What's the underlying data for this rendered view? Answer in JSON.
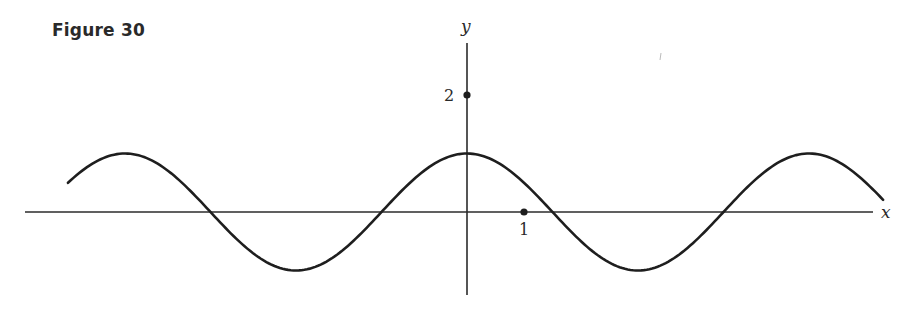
{
  "figure": {
    "title": "Figure 30"
  },
  "axes": {
    "x_label": "x",
    "y_label": "y",
    "marked_points": [
      {
        "label": "2",
        "x": 0,
        "y": 2
      },
      {
        "label": "1",
        "x": 1,
        "y": 0
      }
    ]
  },
  "colors": {
    "ink": "#1e1e1e",
    "background": "#ffffff"
  },
  "chart_data": {
    "type": "line",
    "title": "Figure 30",
    "xlabel": "x",
    "ylabel": "y",
    "function": "y = cos(pi*x/3)",
    "amplitude": 1,
    "period": 6,
    "xlim": [
      -7.2,
      7.1
    ],
    "ylim": [
      -1.4,
      2.9
    ],
    "grid": false,
    "legend": null,
    "labeled_ticks": {
      "x": [
        1
      ],
      "y": [
        2
      ]
    },
    "key_points": {
      "maxima": [
        [
          -6,
          1
        ],
        [
          0,
          1
        ],
        [
          6,
          1
        ]
      ],
      "minima": [
        [
          -3,
          -1
        ],
        [
          3,
          -1
        ]
      ],
      "zeros": [
        -4.5,
        -1.5,
        1.5,
        4.5
      ]
    },
    "curve_x_range": [
      -7.0,
      7.3
    ],
    "series": [
      {
        "name": "y = cos(pi x / 3)",
        "x": [
          -7,
          -6,
          -5,
          -4.5,
          -4,
          -3,
          -2,
          -1.5,
          -1,
          0,
          1,
          1.5,
          2,
          3,
          4,
          4.5,
          5,
          6,
          7
        ],
        "values": [
          0.5,
          1,
          0.5,
          0,
          -0.5,
          -1,
          -0.5,
          0,
          0.5,
          1,
          0.5,
          0,
          -0.5,
          -1,
          -0.5,
          0,
          0.5,
          1,
          0.5
        ]
      }
    ]
  }
}
